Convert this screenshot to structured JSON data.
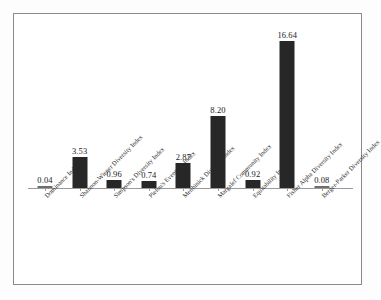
{
  "chart_data": {
    "type": "bar",
    "title": "",
    "subtitle": "",
    "xlabel": "",
    "ylabel": "",
    "ylim": [
      0,
      18
    ],
    "grid": false,
    "legend": false,
    "axis_line": "baseline only",
    "categories": [
      "Dominance Index",
      "Shannon-Wiener Diversity Index",
      "Simpson's Diversity Index",
      "Pielou's Evenness Index",
      "Menhinick Diversity Index",
      "Margalef Community Index",
      "Equitability Index",
      "Fisher Alpha Diversity Index",
      "Berger-Parker Diversity Index"
    ],
    "values": [
      0.04,
      3.53,
      0.96,
      0.74,
      2.87,
      8.2,
      0.92,
      16.64,
      0.08
    ],
    "data_labels": [
      "0.04",
      "3.53",
      "0.96",
      "0.74",
      "2.87",
      "8.20",
      "0.92",
      "16.64",
      "0.08"
    ],
    "bar_color": "#272727",
    "tick_labels_rotated_deg": -45
  },
  "figure": {
    "border_color": "#8a8a8a",
    "background": "#ffffff",
    "baseline_color": "#9b9b9b"
  }
}
